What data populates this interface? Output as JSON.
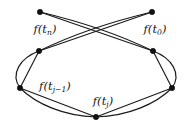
{
  "figure": {
    "kind": "graph-diagram",
    "caption_text": "",
    "background_color": "#ffffff",
    "stroke_color": "#1a1a1a",
    "node_color": "#111111",
    "nodes": [
      {
        "id": "n_top_left",
        "name": "node-f-tn",
        "x": 40,
        "y": 12,
        "r": 2.7
      },
      {
        "id": "n_top_right",
        "name": "node-f-t0",
        "x": 152,
        "y": 12,
        "r": 2.7
      },
      {
        "id": "n_mid_left",
        "name": "node-mid-left",
        "x": 39,
        "y": 51,
        "r": 2.7
      },
      {
        "id": "n_mid_right",
        "name": "node-mid-right",
        "x": 153,
        "y": 51,
        "r": 2.7
      },
      {
        "id": "n_low_left",
        "name": "node-f-tj-1",
        "x": 20,
        "y": 88,
        "r": 2.7
      },
      {
        "id": "n_low_right",
        "name": "node-low-right",
        "x": 172,
        "y": 88,
        "r": 2.7
      },
      {
        "id": "n_bottom",
        "name": "node-f-tj",
        "x": 96,
        "y": 117,
        "r": 2.7
      }
    ],
    "labels": [
      {
        "id": "lbl_tn",
        "name": "label-f-tn",
        "base": "f(t",
        "sub": "n",
        "close": ")",
        "x": 45,
        "y": 30
      },
      {
        "id": "lbl_t0",
        "name": "label-f-t0",
        "base": "f(t",
        "sub": "0",
        "close": ")",
        "x": 155,
        "y": 30
      },
      {
        "id": "lbl_tj1",
        "name": "label-f-tj-1",
        "base": "f(t",
        "sub": "j−1",
        "close": ")",
        "x": 55,
        "y": 87
      },
      {
        "id": "lbl_tj",
        "name": "label-f-tj",
        "base": "f(t",
        "sub": "j",
        "close": ")",
        "x": 103,
        "y": 102
      }
    ],
    "edges": [
      {
        "name": "edge-tn-to-mid-right-straight",
        "kind": "line",
        "from": "n_top_left",
        "to": "n_mid_right"
      },
      {
        "name": "edge-tn-to-mid-right-arc",
        "kind": "curve",
        "from": "n_top_left",
        "to": "n_mid_right"
      },
      {
        "name": "edge-t0-to-mid-left-straight",
        "kind": "line",
        "from": "n_top_right",
        "to": "n_mid_left"
      },
      {
        "name": "edge-t0-to-mid-left-arc",
        "kind": "curve",
        "from": "n_top_right",
        "to": "n_mid_left"
      },
      {
        "name": "edge-mid-left-to-low-left-straight",
        "kind": "line",
        "from": "n_mid_left",
        "to": "n_low_left"
      },
      {
        "name": "edge-mid-left-to-low-left-arc",
        "kind": "curve",
        "from": "n_mid_left",
        "to": "n_low_left"
      },
      {
        "name": "edge-mid-right-to-low-right-straight",
        "kind": "line",
        "from": "n_mid_right",
        "to": "n_low_right"
      },
      {
        "name": "edge-mid-right-to-low-right-arc",
        "kind": "curve",
        "from": "n_mid_right",
        "to": "n_low_right"
      },
      {
        "name": "edge-low-left-to-bottom-straight",
        "kind": "line",
        "from": "n_low_left",
        "to": "n_bottom"
      },
      {
        "name": "edge-low-left-to-bottom-arc",
        "kind": "curve",
        "from": "n_low_left",
        "to": "n_bottom"
      },
      {
        "name": "edge-low-right-to-bottom-straight",
        "kind": "line",
        "from": "n_low_right",
        "to": "n_bottom"
      },
      {
        "name": "edge-low-right-to-bottom-arc",
        "kind": "curve",
        "from": "n_low_right",
        "to": "n_bottom"
      }
    ],
    "paths": {
      "tn_to_midright_line": "M 40 12 L 153 51",
      "tn_to_midright_arc": "M 40 12 C 78 21 120 35 153 51",
      "t0_to_midleft_line": "M 152 12 L 39 51",
      "t0_to_midleft_arc": "M 152 12 C 114 21 72 35 39 51",
      "midleft_to_lowleft_line": "M 39 51 L 20 88",
      "midleft_to_lowleft_arc": "M 39 51 C 20 58 10 74 20 88",
      "midright_to_lowright_line": "M 153 51 L 172 88",
      "midright_to_lowright_arc": "M 153 51 C 172 58 182 74 172 88",
      "lowleft_to_bottom_line": "M 20 88 L 96 117",
      "lowleft_to_bottom_arc": "M 20 88 C 36 104 64 116 96 117",
      "lowright_to_bottom_line": "M 172 88 L 96 117",
      "lowright_to_bottom_arc": "M 172 88 C 156 104 128 116 96 117"
    }
  }
}
